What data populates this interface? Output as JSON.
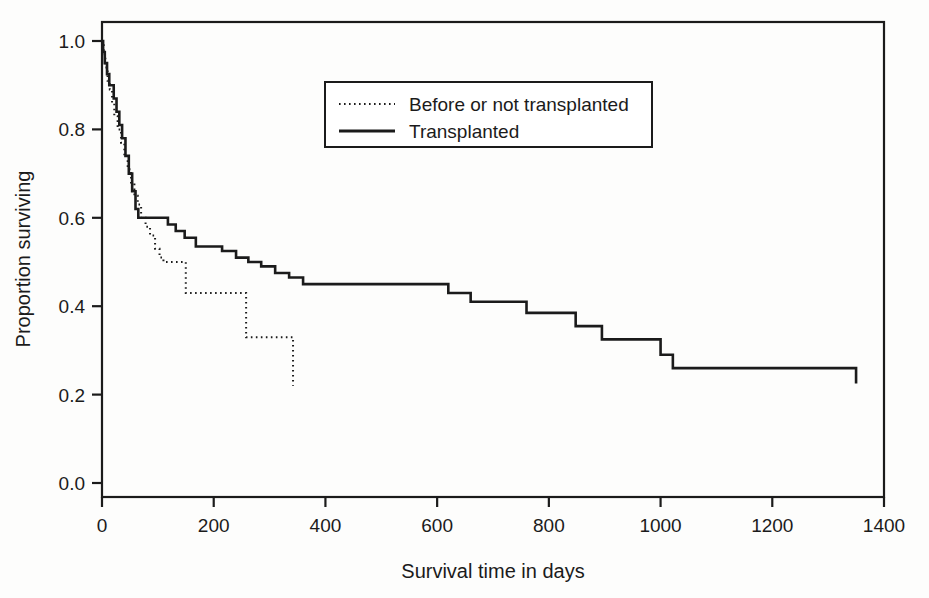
{
  "chart_data": {
    "type": "line",
    "subtype": "kaplan-meier step survival curves",
    "title": "",
    "xlabel": "Survival time in days",
    "ylabel": "Proportion surviving",
    "xlim": [
      0,
      1400
    ],
    "ylim": [
      0.0,
      1.0
    ],
    "xticks": [
      0,
      200,
      400,
      600,
      800,
      1000,
      1200,
      1400
    ],
    "xtick_labels": [
      "0",
      "200",
      "400",
      "600",
      "800",
      "1000",
      "1200",
      "1400"
    ],
    "yticks": [
      0.0,
      0.2,
      0.4,
      0.6,
      0.8,
      1.0
    ],
    "ytick_labels": [
      "0.0",
      "0.2",
      "0.4",
      "0.6",
      "0.8",
      "1.0"
    ],
    "grid": false,
    "legend_position": "upper center",
    "series": [
      {
        "name": "Before or not transplanted",
        "style": "dotted",
        "color": "#1b1b1b",
        "x": [
          0,
          3,
          6,
          10,
          14,
          18,
          22,
          28,
          34,
          40,
          46,
          52,
          58,
          64,
          70,
          78,
          86,
          95,
          103,
          110,
          148,
          150,
          256,
          258,
          340,
          342
        ],
        "y": [
          1.0,
          0.97,
          0.94,
          0.91,
          0.89,
          0.86,
          0.83,
          0.8,
          0.77,
          0.74,
          0.71,
          0.68,
          0.65,
          0.63,
          0.6,
          0.58,
          0.56,
          0.53,
          0.51,
          0.5,
          0.5,
          0.43,
          0.43,
          0.33,
          0.33,
          0.22
        ]
      },
      {
        "name": "Transplanted",
        "style": "solid",
        "color": "#1b1b1b",
        "x": [
          0,
          2,
          5,
          9,
          13,
          17,
          21,
          26,
          31,
          36,
          42,
          48,
          54,
          60,
          65,
          105,
          118,
          132,
          148,
          168,
          190,
          215,
          240,
          262,
          285,
          310,
          335,
          360,
          385,
          548,
          620,
          660,
          725,
          760,
          830,
          848,
          895,
          935,
          1000,
          1022,
          1340,
          1350
        ],
        "y": [
          1.0,
          0.975,
          0.95,
          0.925,
          0.9,
          0.9,
          0.87,
          0.84,
          0.81,
          0.78,
          0.74,
          0.7,
          0.66,
          0.62,
          0.6,
          0.6,
          0.585,
          0.57,
          0.555,
          0.535,
          0.535,
          0.525,
          0.51,
          0.5,
          0.49,
          0.475,
          0.465,
          0.45,
          0.45,
          0.45,
          0.43,
          0.41,
          0.41,
          0.385,
          0.385,
          0.355,
          0.325,
          0.325,
          0.29,
          0.26,
          0.26,
          0.225
        ]
      }
    ]
  },
  "legend": {
    "entries": [
      {
        "label": "Before or not transplanted",
        "style": "dotted"
      },
      {
        "label": "Transplanted",
        "style": "solid"
      }
    ]
  },
  "axes": {
    "x_title": "Survival time in days",
    "y_title": "Proportion surviving"
  }
}
